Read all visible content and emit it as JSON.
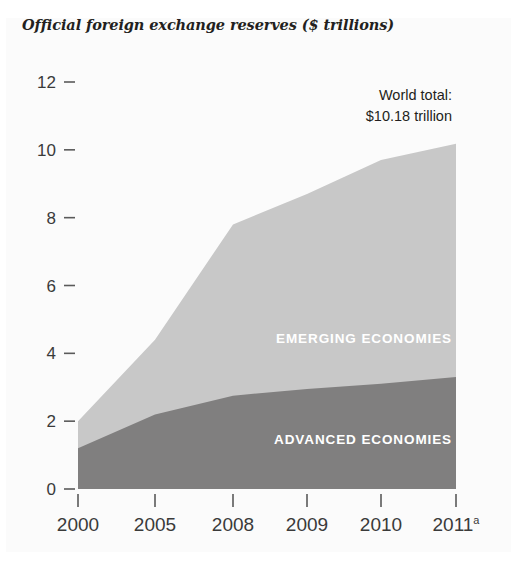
{
  "clipped_headline": "",
  "chart_title": "Official foreign exchange reserves ($ trillions)",
  "annotation": {
    "line1": "World total:",
    "line2": "$10.18 trillion"
  },
  "series_labels": {
    "emerging": "EMERGING ECONOMIES",
    "advanced": "ADVANCED ECONOMIES"
  },
  "colors": {
    "emerging": "#c8c8c8",
    "advanced": "#807f7f",
    "panel_bg": "#fbfbfb",
    "text": "#231f20",
    "tick": "#5a5a5a"
  },
  "axis": {
    "y_ticks": [
      "0",
      "2",
      "4",
      "6",
      "8",
      "10",
      "12"
    ],
    "x_ticks": [
      "2000",
      "2005",
      "2008",
      "2009",
      "2010",
      "2011"
    ],
    "x_tick_superscripts": [
      "",
      "",
      "",
      "",
      "",
      "a"
    ]
  },
  "chart_data": {
    "type": "area",
    "title": "Official foreign exchange reserves ($ trillions)",
    "xlabel": "",
    "ylabel": "$ trillions",
    "ylim": [
      0,
      12
    ],
    "grid": false,
    "legend": "inline-labels",
    "stacked": true,
    "categories": [
      "2000",
      "2005",
      "2008",
      "2009",
      "2010",
      "2011"
    ],
    "series": [
      {
        "name": "ADVANCED ECONOMIES",
        "color": "#807f7f",
        "values": [
          1.2,
          2.2,
          2.75,
          2.95,
          3.1,
          3.3
        ]
      },
      {
        "name": "EMERGING ECONOMIES",
        "color": "#c8c8c8",
        "values": [
          0.8,
          2.2,
          5.05,
          5.75,
          6.6,
          6.88
        ]
      }
    ],
    "totals": [
      2.0,
      4.4,
      7.8,
      8.7,
      9.7,
      10.18
    ],
    "annotations": [
      {
        "text": "World total: $10.18 trillion",
        "position": "top-right"
      }
    ],
    "notes": [
      "a = 2011 figure is preliminary"
    ]
  }
}
